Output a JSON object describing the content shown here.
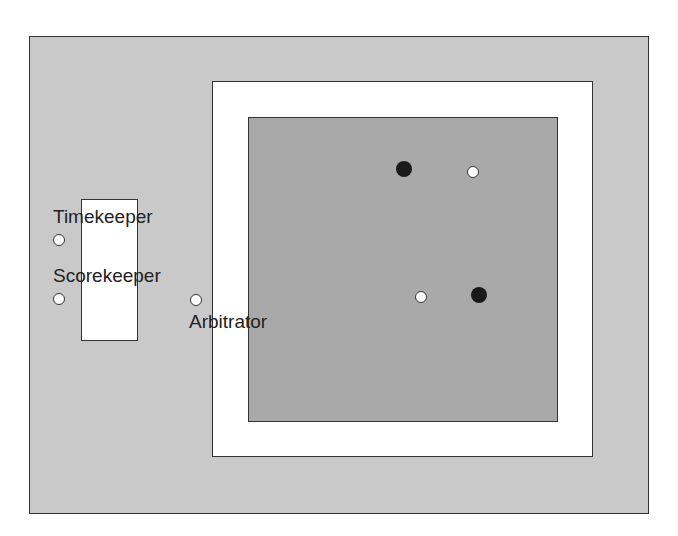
{
  "diagram": {
    "labels": {
      "timekeeper": "Timekeeper",
      "scorekeeper": "Scorekeeper",
      "arbitrator": "Arbitrator"
    },
    "colors": {
      "outer_area": "#c9c9c9",
      "safety_area": "#ffffff",
      "contest_area": "#a9a9a9",
      "table": "#ffffff",
      "official_marker": "#ffffff",
      "competitor_marker": "#1a1a1a"
    },
    "markers": [
      {
        "role": "timekeeper",
        "type": "white",
        "x": 59,
        "y": 240
      },
      {
        "role": "scorekeeper",
        "type": "white",
        "x": 59,
        "y": 299
      },
      {
        "role": "arbitrator",
        "type": "white",
        "x": 196,
        "y": 300
      },
      {
        "role": "competitor",
        "type": "black",
        "x": 404,
        "y": 169
      },
      {
        "role": "referee",
        "type": "white",
        "x": 473,
        "y": 172
      },
      {
        "role": "judge",
        "type": "white",
        "x": 421,
        "y": 297
      },
      {
        "role": "competitor",
        "type": "black",
        "x": 479,
        "y": 295
      }
    ]
  }
}
